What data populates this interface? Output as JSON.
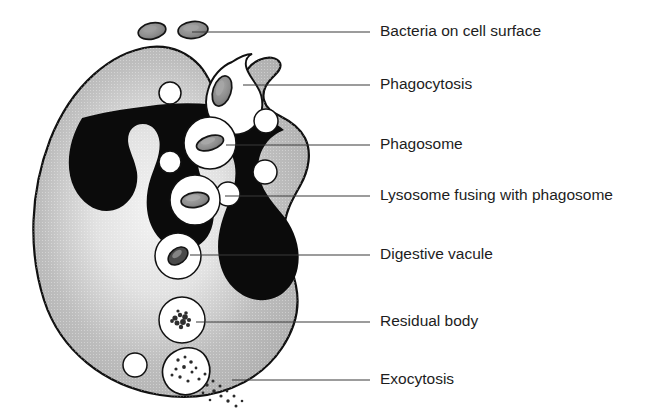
{
  "diagram": {
    "title": "Phagocytosis",
    "background_color": "#ffffff",
    "colors": {
      "cytoplasm_edge": "#b3b3b3",
      "cytoplasm_center": "#f2f2f2",
      "nucleus": "#0b0b0b",
      "outline": "#111111",
      "vesicle_fill": "#ffffff",
      "bacteria_body": "#8a8a8a",
      "bacteria_outline": "#141414",
      "leader_line": "#3a3a3a",
      "label_text": "#1d1d1d"
    }
  },
  "labels": [
    {
      "id": "bacteria-on-cell-surface",
      "text": "Bacteria on cell surface",
      "x": 380,
      "y": 32,
      "leader_from_x": 192,
      "leader_from_y": 32,
      "leader_to_x": 370,
      "leader_to_y": 32
    },
    {
      "id": "phagocytosis",
      "text": "Phagocytosis",
      "x": 380,
      "y": 85,
      "leader_from_x": 243,
      "leader_from_y": 85,
      "leader_to_x": 370,
      "leader_to_y": 85
    },
    {
      "id": "phagosome",
      "text": "Phagosome",
      "x": 380,
      "y": 145,
      "leader_from_x": 226,
      "leader_from_y": 145,
      "leader_to_x": 370,
      "leader_to_y": 145
    },
    {
      "id": "lysosome-fusing-with-phagosome",
      "text": "Lysosome fusing with phagosome",
      "x": 380,
      "y": 196,
      "leader_from_x": 225,
      "leader_from_y": 196,
      "leader_to_x": 370,
      "leader_to_y": 196
    },
    {
      "id": "digestive-vacule",
      "text": "Digestive vacule",
      "x": 380,
      "y": 255,
      "leader_from_x": 190,
      "leader_from_y": 255,
      "leader_to_x": 370,
      "leader_to_y": 255
    },
    {
      "id": "residual-body",
      "text": "Residual body",
      "x": 380,
      "y": 322,
      "leader_from_x": 196,
      "leader_from_y": 322,
      "leader_to_x": 370,
      "leader_to_y": 322
    },
    {
      "id": "exocytosis",
      "text": "Exocytosis",
      "x": 380,
      "y": 380,
      "leader_from_x": 232,
      "leader_from_y": 380,
      "leader_to_x": 370,
      "leader_to_y": 380
    }
  ],
  "structures": {
    "surface_bacteria": [
      {
        "id": "surface-bacterium-1",
        "cx": 152,
        "cy": 31,
        "rx": 14,
        "ry": 8,
        "rotate": -12
      },
      {
        "id": "surface-bacterium-2",
        "cx": 193,
        "cy": 30,
        "rx": 15,
        "ry": 8.5,
        "rotate": -6
      }
    ],
    "engulfed_bacterium": {
      "id": "engulfed-bacterium",
      "cx": 222,
      "cy": 91,
      "rx": 9,
      "ry": 15,
      "rotate": 18
    },
    "phagosome": {
      "id": "phagosome-vesicle",
      "cx": 210,
      "cy": 143,
      "r": 26,
      "bacterium": {
        "rx": 14,
        "ry": 7,
        "rotate": -18
      }
    },
    "lysosome_fusion": {
      "id": "fusing-phagosome-vesicle",
      "cx": 195,
      "cy": 200,
      "r": 25,
      "bacterium": {
        "rx": 14,
        "ry": 7.5,
        "rotate": -8
      },
      "lysosome": {
        "cx": 228,
        "cy": 194,
        "r": 12
      }
    },
    "digestive_vacuole": {
      "id": "digestive-vacuole",
      "cx": 178,
      "cy": 256,
      "r": 23,
      "bacterium": {
        "rx": 11,
        "ry": 7.5,
        "rotate": -38
      }
    },
    "residual_body": {
      "id": "residual-body-vesicle",
      "cx": 182,
      "cy": 320,
      "r": 23
    },
    "free_lysosomes": [
      {
        "id": "lysosome-1",
        "cx": 170,
        "cy": 93,
        "r": 11
      },
      {
        "id": "lysosome-2",
        "cx": 266,
        "cy": 121,
        "r": 12
      },
      {
        "id": "lysosome-3",
        "cx": 170,
        "cy": 162,
        "r": 11
      },
      {
        "id": "lysosome-4",
        "cx": 265,
        "cy": 172,
        "r": 12
      },
      {
        "id": "lysosome-5",
        "cx": 135,
        "cy": 365,
        "r": 12
      }
    ],
    "exocytosis_vesicle": {
      "id": "exocytosis-vesicle",
      "cx": 190,
      "cy": 372
    },
    "nucleus": {
      "id": "nucleus",
      "lobes": 3,
      "description": "multilobed"
    }
  }
}
